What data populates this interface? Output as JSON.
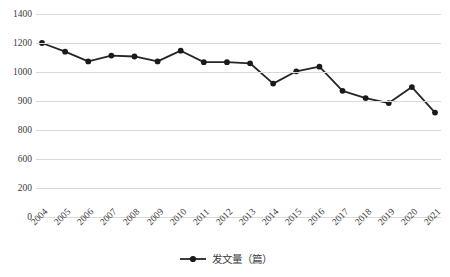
{
  "chart_data": {
    "type": "line",
    "title": "",
    "subtitle": "",
    "xlabel": "",
    "ylabel": "",
    "categories": [
      "2004",
      "2005",
      "2006",
      "2007",
      "2008",
      "2009",
      "2010",
      "2011",
      "2012",
      "2013",
      "2014",
      "2015",
      "2016",
      "2017",
      "2018",
      "2019",
      "2020",
      "2021"
    ],
    "series": [
      {
        "name": "发文量（篇）",
        "values": [
          1200,
          1140,
          1073,
          1113,
          1107,
          1073,
          1147,
          1068,
          1068,
          1060,
          960,
          1005,
          1037,
          935,
          910,
          893,
          948,
          860
        ]
      }
    ],
    "y_tick_labels": [
      "1400",
      "1200",
      "1000",
      "900",
      "800",
      "600",
      "200",
      "0"
    ],
    "y_tick_values": [
      1400,
      1200,
      1000,
      900,
      800,
      600,
      200,
      0
    ],
    "ylim": [
      0,
      1400
    ],
    "grid": true,
    "grid_color": "#d9d9d9",
    "legend_position": "bottom",
    "marker": "filled-circle",
    "line_color": "#262626",
    "marker_color": "#1a1a1a"
  },
  "legend": {
    "label": "发文量（篇）",
    "marker_name": "line-with-circle-marker"
  }
}
